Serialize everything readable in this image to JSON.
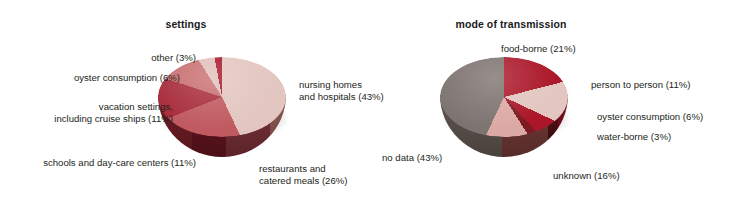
{
  "figure": {
    "background_color": "#ffffff",
    "panels": [
      {
        "id": "settings",
        "title": "settings"
      },
      {
        "id": "transmission",
        "title": "mode of transmission"
      }
    ]
  },
  "chart_data": [
    {
      "type": "pie",
      "title": "settings",
      "xlabel": "",
      "ylabel": "",
      "legend_position": "callout-labels",
      "units": "percent",
      "categories": [
        "nursing homes and hospitals",
        "restaurants and catered meals",
        "schools and day-care centers",
        "vacation settings, including cruise ships",
        "oyster consumption",
        "other"
      ],
      "values": [
        43,
        26,
        11,
        11,
        6,
        3
      ],
      "labels": [
        "nursing homes\nand hospitals (43%)",
        "restaurants and\ncatered meals (26%)",
        "schools and day-care centers (11%)",
        "vacation settings,\nincluding cruise ships (11%)",
        "oyster consumption (6%)",
        "other (3%)"
      ],
      "colors": [
        "#e3c6c0",
        "#c05a60",
        "#a82d3c",
        "#c96f70",
        "#e0bfba",
        "#a8162a"
      ]
    },
    {
      "type": "pie",
      "title": "mode of transmission",
      "xlabel": "",
      "ylabel": "",
      "legend_position": "callout-labels",
      "units": "percent",
      "categories": [
        "food-borne",
        "person to person",
        "oyster consumption",
        "water-borne",
        "unknown",
        "no data"
      ],
      "values": [
        21,
        11,
        6,
        3,
        16,
        43
      ],
      "labels": [
        "food-borne (21%)",
        "person to person (11%)",
        "oyster consumption (6%)",
        "water-borne (3%)",
        "unknown (16%)",
        "no data (43%)"
      ],
      "colors": [
        "#ab1628",
        "#e3c6c0",
        "#ab1628",
        "#7d1a22",
        "#dba9a3",
        "#7d7370"
      ]
    }
  ],
  "settings_chart": {
    "title": "settings",
    "labels": {
      "other": "other (3%)",
      "oyster": "oyster consumption (6%)",
      "vacation_line1": "vacation settings,",
      "vacation_line2": "including cruise ships (11%)",
      "schools": "schools and day-care centers (11%)",
      "restaurants_line1": "restaurants and",
      "restaurants_line2": "catered meals (26%)",
      "nursing_line1": "nursing homes",
      "nursing_line2": "and hospitals (43%)"
    }
  },
  "transmission_chart": {
    "title": "mode of transmission",
    "labels": {
      "foodborne": "food-borne (21%)",
      "person": "person to person (11%)",
      "oyster": "oyster consumption (6%)",
      "waterborne": "water-borne (3%)",
      "unknown": "unknown (16%)",
      "nodata": "no data (43%)"
    }
  }
}
